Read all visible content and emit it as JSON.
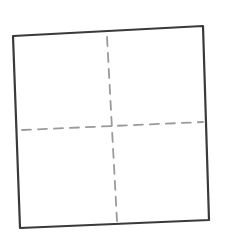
{
  "diagram": {
    "colors": {
      "background": "#ffffff",
      "outline": "#3a3a3a",
      "dashes": "#9a9a9a"
    },
    "square": {
      "corners": [
        [
          13,
          36
        ],
        [
          203,
          26
        ],
        [
          209,
          220
        ],
        [
          20,
          228
        ]
      ],
      "stroke_width": 2.2
    },
    "vertical_divider": {
      "from": [
        107,
        37
      ],
      "to": [
        117,
        221
      ],
      "dash": "9 7",
      "stroke_width": 1.8
    },
    "horizontal_divider": {
      "from": [
        22,
        130
      ],
      "to": [
        203,
        122
      ],
      "dash": "9 7",
      "stroke_width": 1.8
    },
    "center_mark": [
      112,
      127
    ]
  }
}
